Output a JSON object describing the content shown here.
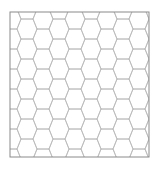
{
  "figure": {
    "type": "hexagonal-grid",
    "orientation": "flat-top",
    "background": "#ffffff",
    "frame": {
      "x": 10,
      "y": 12,
      "width": 139,
      "height": 145,
      "stroke": "#8a8a8a",
      "stroke_width": 1
    },
    "grid": {
      "stroke": "#b8b8b8",
      "stroke_width": 0.8,
      "origin_x": 21,
      "origin_y": 19,
      "edge_length": 12,
      "slant_dx": 4,
      "half_height": 10,
      "period_x": 32,
      "period_y": 20
    }
  }
}
